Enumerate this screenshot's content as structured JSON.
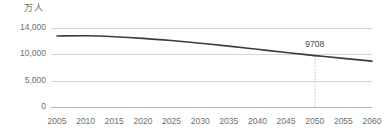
{
  "chart_data": {
    "type": "line",
    "title": "",
    "subtitle": "",
    "xlabel": "",
    "ylabel": "万人",
    "unit_label": "万人",
    "grid": true,
    "legend": false,
    "legend_position": "none",
    "xlim": [
      2005,
      2060
    ],
    "ylim": [
      0,
      14000
    ],
    "x_tick_labels": [
      "2005",
      "2010",
      "2015",
      "2020",
      "2025",
      "2030",
      "2035",
      "2040",
      "2045",
      "2050",
      "2055",
      "2060"
    ],
    "x": [
      2005,
      2010,
      2015,
      2020,
      2025,
      2030,
      2035,
      2040,
      2045,
      2050,
      2055,
      2060
    ],
    "y_tick_labels": [
      "14,000",
      "10,000",
      "5,000",
      "0"
    ],
    "y_ticks": [
      14000,
      10000,
      5000,
      0
    ],
    "series": [
      {
        "name": "総人口",
        "color": "#3c3c3c",
        "values": [
          12777,
          12806,
          12660,
          12410,
          12066,
          11662,
          11212,
          10728,
          10221,
          9708,
          9193,
          8674
        ]
      }
    ],
    "annotations": [
      {
        "label": "9708",
        "x": 2050,
        "y": 9708,
        "dropline": true,
        "dropline_style": "dotted"
      }
    ]
  },
  "colors": {
    "line": "#3c3c3c",
    "grid": "#c9c9c9",
    "axis": "#b4b4b4",
    "text": "#6e6e6e",
    "annotation_text": "#4a4a4a",
    "dropline": "#b0b0b0",
    "background": "#ffffff"
  }
}
